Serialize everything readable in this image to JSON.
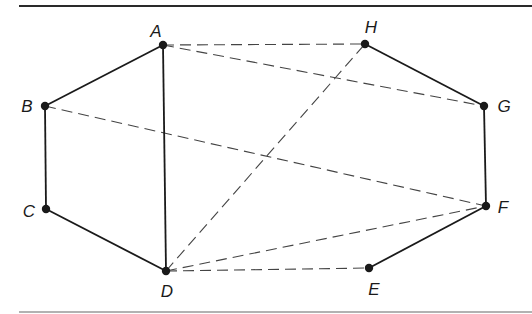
{
  "diagram": {
    "type": "graph",
    "colors": {
      "line": "#1a1a1a",
      "dashed": "#444444",
      "border_top": "#2a2a2a",
      "border_bottom": "#555555",
      "background": "#ffffff"
    },
    "vertices": [
      {
        "id": "A",
        "label": "A",
        "x": 163,
        "y": 45,
        "lx": 156,
        "ly": 37,
        "anchor": "middle"
      },
      {
        "id": "B",
        "label": "B",
        "x": 45,
        "y": 106,
        "lx": 27,
        "ly": 112,
        "anchor": "middle"
      },
      {
        "id": "C",
        "label": "C",
        "x": 46,
        "y": 209,
        "lx": 29,
        "ly": 217,
        "anchor": "middle"
      },
      {
        "id": "D",
        "label": "D",
        "x": 166,
        "y": 271,
        "lx": 167,
        "ly": 297,
        "anchor": "middle"
      },
      {
        "id": "E",
        "label": "E",
        "x": 369,
        "y": 268,
        "lx": 374,
        "ly": 295,
        "anchor": "middle"
      },
      {
        "id": "F",
        "label": "F",
        "x": 486,
        "y": 206,
        "lx": 503,
        "ly": 213,
        "anchor": "middle"
      },
      {
        "id": "G",
        "label": "G",
        "x": 484,
        "y": 106,
        "lx": 504,
        "ly": 112,
        "anchor": "middle"
      },
      {
        "id": "H",
        "label": "H",
        "x": 365,
        "y": 44,
        "lx": 371,
        "ly": 33,
        "anchor": "middle"
      }
    ],
    "solid_edges": [
      [
        "A",
        "B"
      ],
      [
        "B",
        "C"
      ],
      [
        "C",
        "D"
      ],
      [
        "A",
        "D"
      ],
      [
        "E",
        "F"
      ],
      [
        "F",
        "G"
      ],
      [
        "G",
        "H"
      ]
    ],
    "dashed_edges": [
      [
        "A",
        "H"
      ],
      [
        "A",
        "G"
      ],
      [
        "B",
        "F"
      ],
      [
        "D",
        "H"
      ],
      [
        "D",
        "F"
      ],
      [
        "D",
        "E"
      ]
    ],
    "borders": {
      "top": {
        "x1": 19,
        "x2": 532,
        "y": 6
      },
      "bottom": {
        "x1": 19,
        "x2": 532,
        "y": 312
      }
    }
  }
}
